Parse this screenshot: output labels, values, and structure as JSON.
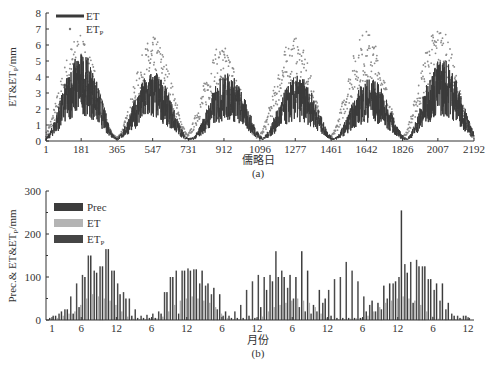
{
  "chart_data": [
    {
      "panel": "(a)",
      "type": "line",
      "title": "",
      "xlabel": "儒略日",
      "ylabel": "ET&ETp/mm",
      "xlim": [
        1,
        2192
      ],
      "ylim": [
        0,
        8
      ],
      "xticks": [
        1,
        181,
        365,
        547,
        731,
        912,
        1096,
        1277,
        1461,
        1642,
        1826,
        2007,
        2192
      ],
      "yticks": [
        0,
        1,
        2,
        3,
        4,
        5,
        6,
        7,
        8
      ],
      "legend": [
        "ET",
        "ETp"
      ],
      "legend_position": "upper left",
      "series": [
        {
          "name": "ET",
          "style": "line",
          "color": "#3a3a3a",
          "annual_peak_day": [
            181,
            547,
            930,
            1290,
            1660,
            2030
          ],
          "annual_peak_value": [
            5.3,
            4.2,
            4.1,
            3.9,
            3.8,
            5.0
          ],
          "winter_value": 0.2
        },
        {
          "name": "ETp",
          "style": "scatter",
          "color": "#8a8a8a",
          "annual_peak_day": [
            170,
            550,
            900,
            1270,
            1640,
            2010
          ],
          "annual_peak_value": [
            6.3,
            6.2,
            5.7,
            6.2,
            6.6,
            6.9
          ],
          "winter_value": 0.3
        }
      ]
    },
    {
      "panel": "(b)",
      "type": "bar",
      "title": "",
      "xlabel": "月份",
      "ylabel": "Prec.& ET&ETp/mm",
      "ylim": [
        0,
        300
      ],
      "yticks": [
        0,
        100,
        200,
        300
      ],
      "xtick_labels": [
        "1",
        "6",
        "12",
        "6",
        "12",
        "6",
        "12",
        "6",
        "12",
        "6",
        "12",
        "6",
        "12"
      ],
      "legend": [
        "Prec",
        "ET",
        "ETp"
      ],
      "legend_position": "upper left",
      "categories_count": 72,
      "series": [
        {
          "name": "Prec",
          "color": "#3c3c3c",
          "values": [
            5,
            10,
            20,
            25,
            15,
            30,
            100,
            150,
            110,
            125,
            165,
            115,
            60,
            50,
            10,
            5,
            5,
            5,
            5,
            15,
            65,
            100,
            15,
            115,
            115,
            118,
            115,
            85,
            75,
            60,
            20,
            5,
            5,
            5,
            10,
            5,
            30,
            70,
            90,
            100,
            100,
            105,
            100,
            160,
            115,
            35,
            70,
            50,
            10,
            5,
            5,
            5,
            5,
            5,
            20,
            45,
            40,
            80,
            85,
            90,
            255,
            110,
            40,
            125,
            125,
            95,
            85,
            85,
            40,
            10,
            5,
            10
          ]
        },
        {
          "name": "ET",
          "color": "#b0b0b0",
          "values": [
            3,
            5,
            10,
            15,
            20,
            35,
            50,
            60,
            55,
            50,
            45,
            35,
            20,
            8,
            3,
            2,
            2,
            3,
            4,
            8,
            20,
            35,
            45,
            50,
            55,
            50,
            45,
            40,
            30,
            15,
            5,
            2,
            2,
            2,
            3,
            4,
            8,
            20,
            30,
            35,
            40,
            45,
            50,
            45,
            40,
            30,
            15,
            5,
            2,
            2,
            2,
            3,
            4,
            5,
            10,
            20,
            30,
            40,
            45,
            50,
            55,
            50,
            45,
            35,
            20,
            8,
            3,
            2,
            2,
            2,
            3,
            4
          ]
        },
        {
          "name": "ETp",
          "color": "#4a4a4a",
          "values": [
            10,
            15,
            25,
            55,
            85,
            105,
            150,
            115,
            125,
            165,
            115,
            85,
            65,
            50,
            25,
            10,
            12,
            15,
            20,
            65,
            100,
            115,
            115,
            120,
            118,
            85,
            80,
            60,
            25,
            10,
            10,
            20,
            35,
            70,
            90,
            105,
            100,
            105,
            160,
            115,
            75,
            50,
            30,
            20,
            15,
            20,
            40,
            70,
            95,
            100,
            135,
            115,
            90,
            55,
            35,
            20,
            25,
            50,
            85,
            100,
            130,
            135,
            140,
            125,
            95,
            70,
            45,
            25,
            15,
            10,
            10,
            5
          ]
        }
      ]
    }
  ],
  "panel_labels": {
    "a": "(a)",
    "b": "(b)"
  },
  "chart_a": {
    "xlabel": "儒略日",
    "ylabel": "ET&ET",
    "ylabel_sub": "P",
    "ylabel_suffix": "/mm",
    "legend_et": "ET",
    "legend_etp": "ET",
    "legend_etp_sub": "P",
    "yticks": [
      "0",
      "1",
      "2",
      "3",
      "4",
      "5",
      "6",
      "7",
      "8"
    ],
    "xticks": [
      "1",
      "181",
      "365",
      "547",
      "731",
      "912",
      "1096",
      "1277",
      "1461",
      "1642",
      "1826",
      "2007",
      "2192"
    ]
  },
  "chart_b": {
    "xlabel": "月份",
    "ylabel": "Prec.& ET&ET",
    "ylabel_sub": "P",
    "ylabel_suffix": "/mm",
    "legend_prec": "Prec",
    "legend_et": "ET",
    "legend_etp": "ET",
    "legend_etp_sub": "P",
    "yticks": [
      "0",
      "100",
      "200",
      "300"
    ],
    "xticks": [
      "1",
      "6",
      "12",
      "6",
      "12",
      "6",
      "12",
      "6",
      "12",
      "6",
      "12",
      "6",
      "12"
    ]
  }
}
